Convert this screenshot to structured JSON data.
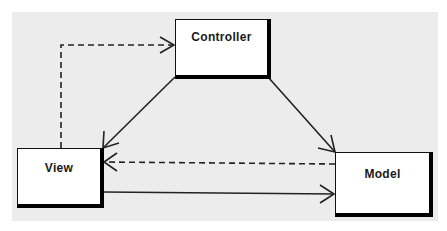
{
  "diagram": {
    "type": "mvc-class-diagram",
    "background_color": "#ececec",
    "nodes": [
      {
        "id": "controller",
        "label": "Controller"
      },
      {
        "id": "view",
        "label": "View"
      },
      {
        "id": "model",
        "label": "Model"
      }
    ],
    "edges": [
      {
        "from": "view",
        "to": "controller",
        "style": "dashed",
        "arrow": "open"
      },
      {
        "from": "controller",
        "to": "view",
        "style": "solid",
        "arrow": "open"
      },
      {
        "from": "controller",
        "to": "model",
        "style": "solid",
        "arrow": "open"
      },
      {
        "from": "model",
        "to": "view",
        "style": "dashed",
        "arrow": "open"
      },
      {
        "from": "view",
        "to": "model",
        "style": "solid",
        "arrow": "open"
      }
    ]
  }
}
